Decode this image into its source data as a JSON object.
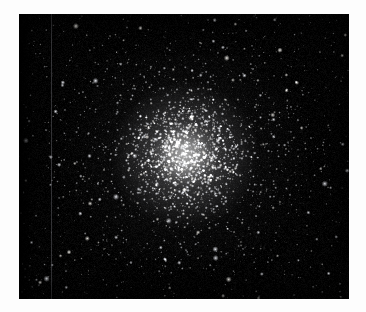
{
  "page": {
    "background_color": "#fdfdfd",
    "width": 366,
    "height": 312
  },
  "plate": {
    "caption": "",
    "label": "globular-cluster-plate",
    "left": 19,
    "top": 14,
    "width": 330,
    "height": 285,
    "background_color": "#030303",
    "medium": "grayscale astronomical photograph",
    "subject": "globular star cluster",
    "artifacts": [
      {
        "name": "vertical-column-defect",
        "type": "line",
        "x": 32,
        "color": "#7a7a82",
        "opacity": 0.4
      },
      {
        "name": "left-edge-vignette",
        "type": "gradient",
        "color": "#000000"
      }
    ]
  },
  "chart_data": {
    "type": "scatter",
    "title": "",
    "subtitle": "",
    "xlabel": "",
    "ylabel": "",
    "grid": false,
    "legend": null,
    "xlim": [
      0,
      330
    ],
    "ylim": [
      0,
      285
    ],
    "center": {
      "x": 166,
      "y": 141
    },
    "core_radius": 34,
    "half_light_radius": 74,
    "tidal_radius": 210,
    "star_count": 5200,
    "background_star_count": 520,
    "colors": {
      "sky": "#030303",
      "star_bright": "#ffffff",
      "star_mid": "#c8c8cc",
      "star_faint": "#5a5a62",
      "core_glow": "#ffffff",
      "defect": "#7a7a82"
    },
    "density_profile": {
      "model": "inverse-power-law-with-core",
      "note": "density proportional to 1/(1+(r/core_radius)^2)^1.05"
    },
    "brightness_profile": {
      "model": "radial",
      "note": "mean star luminosity rises toward the centre; outer halo stars are faint"
    },
    "radial_bins": {
      "r_px": [
        0,
        20,
        40,
        60,
        80,
        100,
        120,
        140,
        160,
        180,
        200,
        220
      ],
      "relative_surface_density": [
        1.0,
        0.82,
        0.47,
        0.26,
        0.16,
        0.1,
        0.068,
        0.048,
        0.035,
        0.027,
        0.021,
        0.017
      ],
      "relative_mean_brightness": [
        1.0,
        0.9,
        0.74,
        0.58,
        0.46,
        0.37,
        0.3,
        0.25,
        0.21,
        0.18,
        0.16,
        0.14
      ]
    },
    "random_seed": 20240917
  }
}
